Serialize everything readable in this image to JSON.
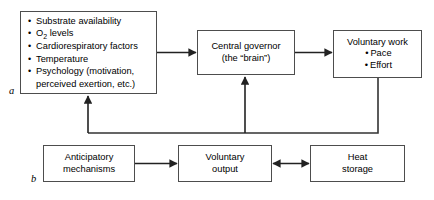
{
  "diagram": {
    "panels": [
      {
        "id": "a",
        "label": "a"
      },
      {
        "id": "b",
        "label": "b"
      }
    ],
    "nodes": {
      "factors": {
        "name": "afferent-factors",
        "items": [
          {
            "text_before": "Substrate availability",
            "sub": "",
            "text_after": ""
          },
          {
            "text_before": "O",
            "sub": "2",
            "text_after": " levels"
          },
          {
            "text_before": "Cardiorespiratory factors",
            "sub": "",
            "text_after": ""
          },
          {
            "text_before": "Temperature",
            "sub": "",
            "text_after": ""
          },
          {
            "text_before": "Psychology (motivation,",
            "sub": "",
            "text_after": ""
          }
        ],
        "continuation": "perceived exertion, etc.)"
      },
      "governor": {
        "line1": "Central governor",
        "line2": "(the “brain”)"
      },
      "voluntary_work": {
        "heading": "Voluntary work",
        "bullets": [
          "Pace",
          "Effort"
        ]
      },
      "anticipatory": {
        "line1": "Anticipatory",
        "line2": "mechanisms"
      },
      "voluntary_output": {
        "line1": "Voluntary",
        "line2": "output"
      },
      "heat_storage": {
        "line1": "Heat",
        "line2": "storage"
      }
    },
    "edges": [
      {
        "id": "factors-to-governor",
        "from": "factors",
        "to": "governor",
        "heads": "single"
      },
      {
        "id": "governor-to-voluntary-work",
        "from": "governor",
        "to": "voluntary_work",
        "heads": "single"
      },
      {
        "id": "anticipatory-to-voluntary-output",
        "from": "anticipatory",
        "to": "voluntary_output",
        "heads": "single"
      },
      {
        "id": "voluntary-output-to-heat-storage",
        "from": "voluntary_output",
        "to": "heat_storage",
        "heads": "double"
      },
      {
        "id": "feedback-to-factors",
        "from": "voluntary_work",
        "to": "factors",
        "heads": "single"
      },
      {
        "id": "feedback-to-governor",
        "from": "voluntary_work",
        "to": "governor",
        "heads": "single"
      }
    ],
    "colors": {
      "stroke": "#4d4d4d",
      "line": "#333333",
      "text": "#000000",
      "background": "#ffffff"
    },
    "bullet_glyph": "•"
  }
}
